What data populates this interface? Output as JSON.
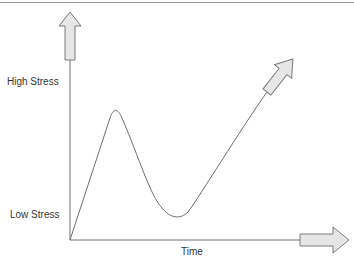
{
  "diagram": {
    "y_axis": {
      "high_label": "High Stress",
      "low_label": "Low Stress"
    },
    "x_axis": {
      "label": "Time"
    },
    "colors": {
      "line": "#6e6e6e",
      "arrow_fill": "#e6e6e6",
      "arrow_stroke": "#7a7a7a",
      "text": "#333333"
    }
  }
}
